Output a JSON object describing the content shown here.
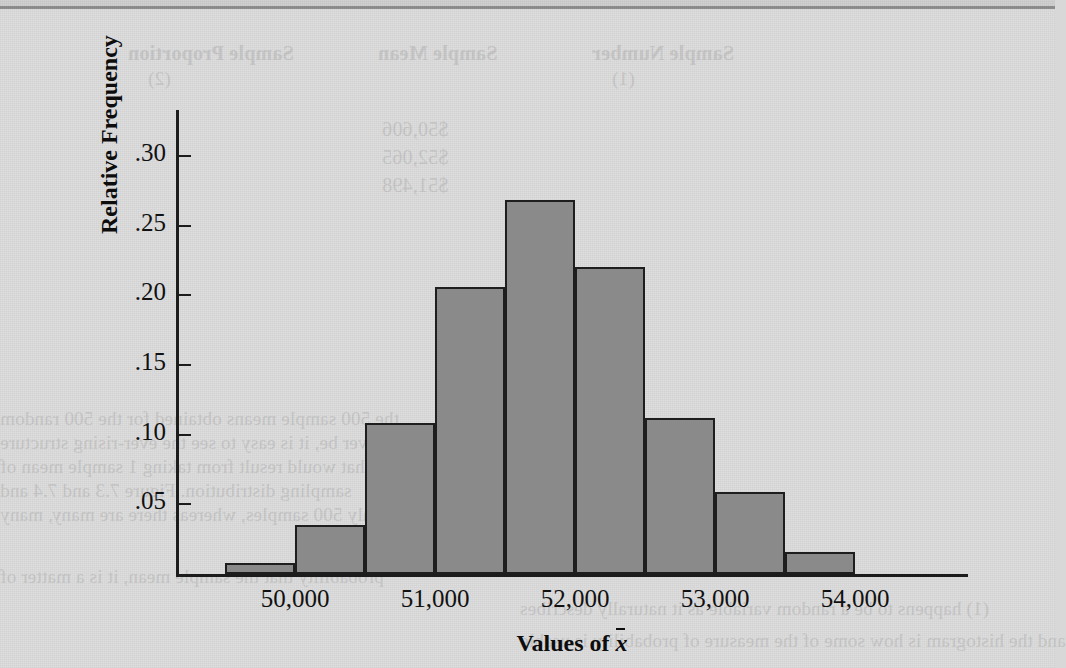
{
  "figure": {
    "y_axis_title": "Relative Frequency",
    "x_axis_title_prefix": "Values of ",
    "x_axis_title_symbol": "x",
    "y_tick_labels": [
      ".30",
      ".25",
      ".20",
      ".15",
      ".10",
      ".05"
    ],
    "x_tick_labels": [
      "50,000",
      "51,000",
      "52,000",
      "53,000",
      "54,000"
    ]
  },
  "background_text": {
    "table_headers": [
      "Sample Number",
      "Sample Mean",
      "Sample Proportion"
    ],
    "table_header_subs": [
      "(1)",
      "(2)"
    ],
    "rows": [
      "$50,606",
      "$52,065",
      "$51,498"
    ],
    "paragraph_lines": [
      "the 500 sample means obtained for the 500 random",
      "could ever be, it is easy to see the ever-rising structure",
      "that would result from taking 1 sample mean of",
      "sampling distribution. Figure 7.3 and 7.4 and",
      "only 500 samples, whereas there are many, many",
      "probability that the sample mean, it is a matter of",
      "(1) happens to be a random variable as it naturally describes",
      "and the histogram is how some of the measure of probability is usable"
    ]
  },
  "chart_data": {
    "type": "bar",
    "title": "",
    "xlabel": "Values of x̄",
    "ylabel": "Relative Frequency",
    "ylim": [
      0,
      0.33
    ],
    "yticks": [
      0.05,
      0.1,
      0.15,
      0.2,
      0.25,
      0.3
    ],
    "ytick_labels": [
      ".05",
      ".10",
      ".15",
      ".20",
      ".25",
      ".30"
    ],
    "xlim": [
      49500,
      54500
    ],
    "xticks": [
      50000,
      51000,
      52000,
      53000,
      54000
    ],
    "xtick_labels": [
      "50,000",
      "51,000",
      "52,000",
      "53,000",
      "54,000"
    ],
    "grid": false,
    "legend": false,
    "bin_edges": [
      49500,
      50000,
      50500,
      51000,
      51500,
      52000,
      52500,
      53000,
      53500,
      54000,
      54500
    ],
    "categories": [
      "49,500-50,000",
      "50,000-50,500",
      "50,500-51,000",
      "51,000-51,500",
      "51,500-52,000",
      "52,000-52,500",
      "52,500-53,000",
      "53,000-53,500",
      "53,500-54,000",
      "54,000-54,500"
    ],
    "values": [
      0.008,
      0.035,
      0.108,
      0.206,
      0.268,
      0.22,
      0.112,
      0.059,
      0.016,
      0.0
    ],
    "bar_color": "#8a8a8a",
    "bar_edge_color": "#1e1e1e"
  }
}
